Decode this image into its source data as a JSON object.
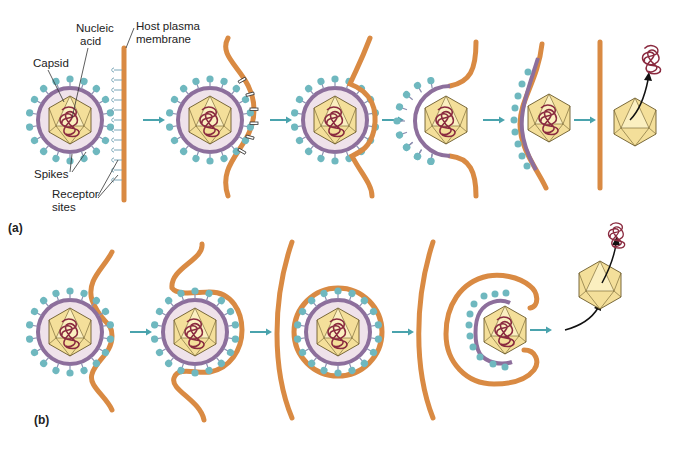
{
  "figure": {
    "panels": [
      {
        "id": "a",
        "label": "(a)",
        "description": "Fusion of viral envelope with host plasma membrane; capsid enters cell and nucleic acid is released"
      },
      {
        "id": "b",
        "label": "(b)",
        "description": "Endocytosis of enveloped virus; vesicle envelope fuses, capsid released and nucleic acid uncoated"
      }
    ],
    "labels": {
      "nucleic_acid_1": "Nucleic",
      "nucleic_acid_2": "acid",
      "capsid": "Capsid",
      "host_membrane_1": "Host plasma",
      "host_membrane_2": "membrane",
      "spikes": "Spikes",
      "receptor_1": "Receptor",
      "receptor_2": "sites"
    },
    "colors": {
      "membrane": "#d98a43",
      "envelope": "#8d6f9c",
      "spike": "#6fb8bf",
      "envelope_fill": "#efe2ea",
      "capsid": "#f4df9a",
      "nucleic_acid": "#8a2a3f",
      "arrow": "#4aa3ad"
    }
  }
}
